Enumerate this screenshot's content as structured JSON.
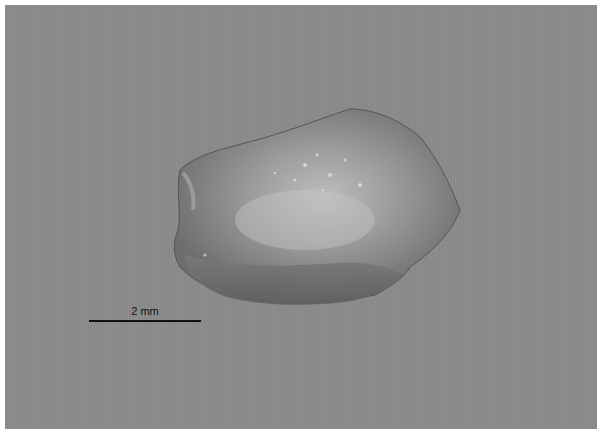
{
  "image": {
    "subject": "specimen fragment photographed on gray background",
    "background_color": "#8a8a8a",
    "border_color": "#ffffff"
  },
  "scale_bar": {
    "label": "2 mm",
    "color": "#111111"
  }
}
